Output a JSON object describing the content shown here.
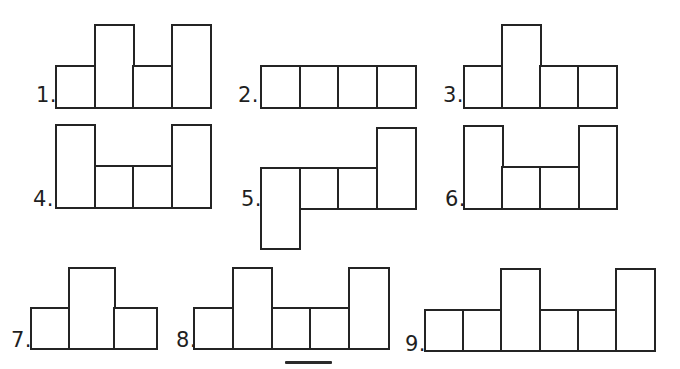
{
  "style": {
    "background": "#ffffff",
    "line_color": "#242424",
    "line_width": 2.6,
    "label_color": "#1f1f1f",
    "label_font_size": 21
  },
  "figures": [
    {
      "label": "1.",
      "label_x": 36,
      "label_bottom": 104,
      "x": 55,
      "baseline": 106,
      "unit_w": 38.5,
      "unit_h": 41,
      "columns": [
        {
          "h": 1
        },
        {
          "h": 2
        },
        {
          "h": 1
        },
        {
          "h": 2
        }
      ]
    },
    {
      "label": "2.",
      "label_x": 238,
      "label_bottom": 104,
      "x": 260,
      "baseline": 106,
      "unit_w": 38.5,
      "unit_h": 41,
      "columns": [
        {
          "h": 1
        },
        {
          "h": 1
        },
        {
          "h": 1
        },
        {
          "h": 1
        }
      ]
    },
    {
      "label": "3.",
      "label_x": 443,
      "label_bottom": 104,
      "x": 463,
      "baseline": 106,
      "unit_w": 38,
      "unit_h": 41,
      "columns": [
        {
          "h": 1
        },
        {
          "h": 2
        },
        {
          "h": 1
        },
        {
          "h": 1
        }
      ]
    },
    {
      "label": "4.",
      "label_x": 33,
      "label_bottom": 208,
      "x": 55,
      "baseline": 206,
      "unit_w": 38.5,
      "unit_h": 41,
      "columns": [
        {
          "h": 2
        },
        {
          "h": 1
        },
        {
          "h": 1
        },
        {
          "h": 2
        }
      ]
    },
    {
      "label": "5.",
      "label_x": 241,
      "label_bottom": 208,
      "x": 260,
      "baseline": 207,
      "unit_w": 38.5,
      "unit_h": 40,
      "columns": [
        {
          "h": 2,
          "drop": 1
        },
        {
          "h": 1
        },
        {
          "h": 1
        },
        {
          "h": 2
        }
      ]
    },
    {
      "label": "6.",
      "label_x": 445,
      "label_bottom": 208,
      "x": 463,
      "baseline": 207,
      "unit_w": 38.2,
      "unit_h": 41,
      "columns": [
        {
          "h": 2
        },
        {
          "h": 1
        },
        {
          "h": 1
        },
        {
          "h": 2
        }
      ]
    },
    {
      "label": "7.",
      "label_x": 11,
      "label_bottom": 349,
      "x": 30,
      "baseline": 347,
      "unit_w": 41.5,
      "unit_h": 40,
      "columns": [
        {
          "h": 1,
          "w": 38
        },
        {
          "h": 2,
          "w": 45
        },
        {
          "h": 1,
          "w": 42
        }
      ]
    },
    {
      "label": "8.",
      "label_x": 176,
      "label_bottom": 349,
      "x": 193,
      "baseline": 347,
      "unit_w": 38.8,
      "unit_h": 40,
      "columns": [
        {
          "h": 1
        },
        {
          "h": 2
        },
        {
          "h": 1
        },
        {
          "h": 1
        },
        {
          "h": 2
        }
      ]
    },
    {
      "label": "9.",
      "label_x": 405,
      "label_bottom": 353,
      "x": 424,
      "baseline": 349,
      "unit_w": 38.2,
      "unit_h": 40.5,
      "columns": [
        {
          "h": 1
        },
        {
          "h": 1
        },
        {
          "h": 2
        },
        {
          "h": 1
        },
        {
          "h": 1
        },
        {
          "h": 2
        }
      ]
    }
  ],
  "artifacts": {
    "cropped_shape_edge": {
      "x": 285,
      "y": 361,
      "width": 47,
      "height": 3
    }
  }
}
